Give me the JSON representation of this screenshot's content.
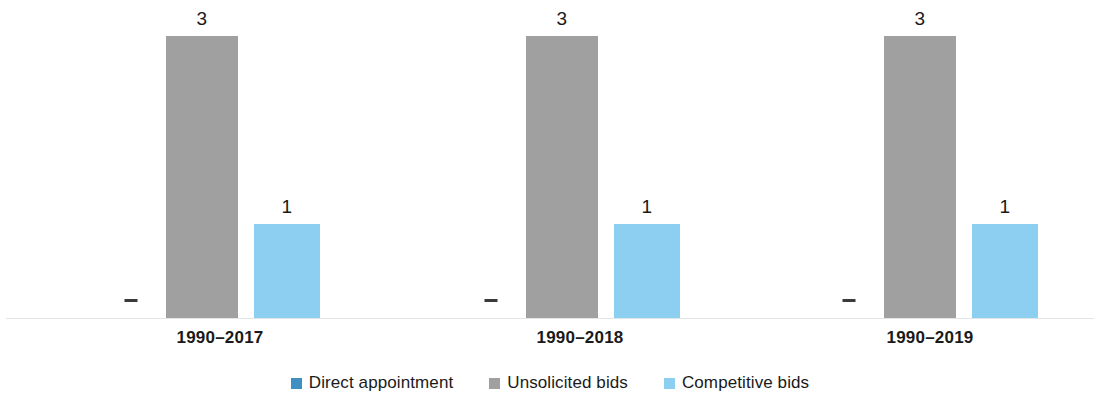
{
  "chart_data": {
    "type": "bar",
    "title": "",
    "subtitle": "",
    "xlabel": "",
    "ylabel": "",
    "ylim": [
      0,
      3.4
    ],
    "grid": false,
    "legend_position": "bottom-center",
    "categories": [
      "1990–2017",
      "1990–2018",
      "1990–2019"
    ],
    "series": [
      {
        "name": "Direct appointment",
        "color": "#3f8fc4",
        "values": [
          0,
          0,
          0
        ],
        "value_labels": [
          "-",
          "-",
          "-"
        ]
      },
      {
        "name": "Unsolicited bids",
        "color": "#a0a0a0",
        "values": [
          3,
          3,
          3
        ],
        "value_labels": [
          "3",
          "3",
          "3"
        ]
      },
      {
        "name": "Competitive bids",
        "color": "#8ccff0",
        "values": [
          1,
          1,
          1
        ],
        "value_labels": [
          "1",
          "1",
          "1"
        ]
      }
    ]
  },
  "axis": {
    "baseline_color": "#e3e6e8"
  },
  "groups": [
    {
      "category": "1990–2017",
      "bars": [
        {
          "series": "Direct appointment",
          "value": 0,
          "label": "-"
        },
        {
          "series": "Unsolicited bids",
          "value": 3,
          "label": "3"
        },
        {
          "series": "Competitive bids",
          "value": 1,
          "label": "1"
        }
      ]
    },
    {
      "category": "1990–2018",
      "bars": [
        {
          "series": "Direct appointment",
          "value": 0,
          "label": "-"
        },
        {
          "series": "Unsolicited bids",
          "value": 3,
          "label": "3"
        },
        {
          "series": "Competitive bids",
          "value": 1,
          "label": "1"
        }
      ]
    },
    {
      "category": "1990–2019",
      "bars": [
        {
          "series": "Direct appointment",
          "value": 0,
          "label": "-"
        },
        {
          "series": "Unsolicited bids",
          "value": 3,
          "label": "3"
        },
        {
          "series": "Competitive bids",
          "value": 1,
          "label": "1"
        }
      ]
    }
  ],
  "legend": {
    "items": [
      {
        "label": "Direct appointment",
        "color": "#3f8fc4"
      },
      {
        "label": "Unsolicited bids",
        "color": "#a0a0a0"
      },
      {
        "label": "Competitive bids",
        "color": "#8ccff0"
      }
    ]
  }
}
